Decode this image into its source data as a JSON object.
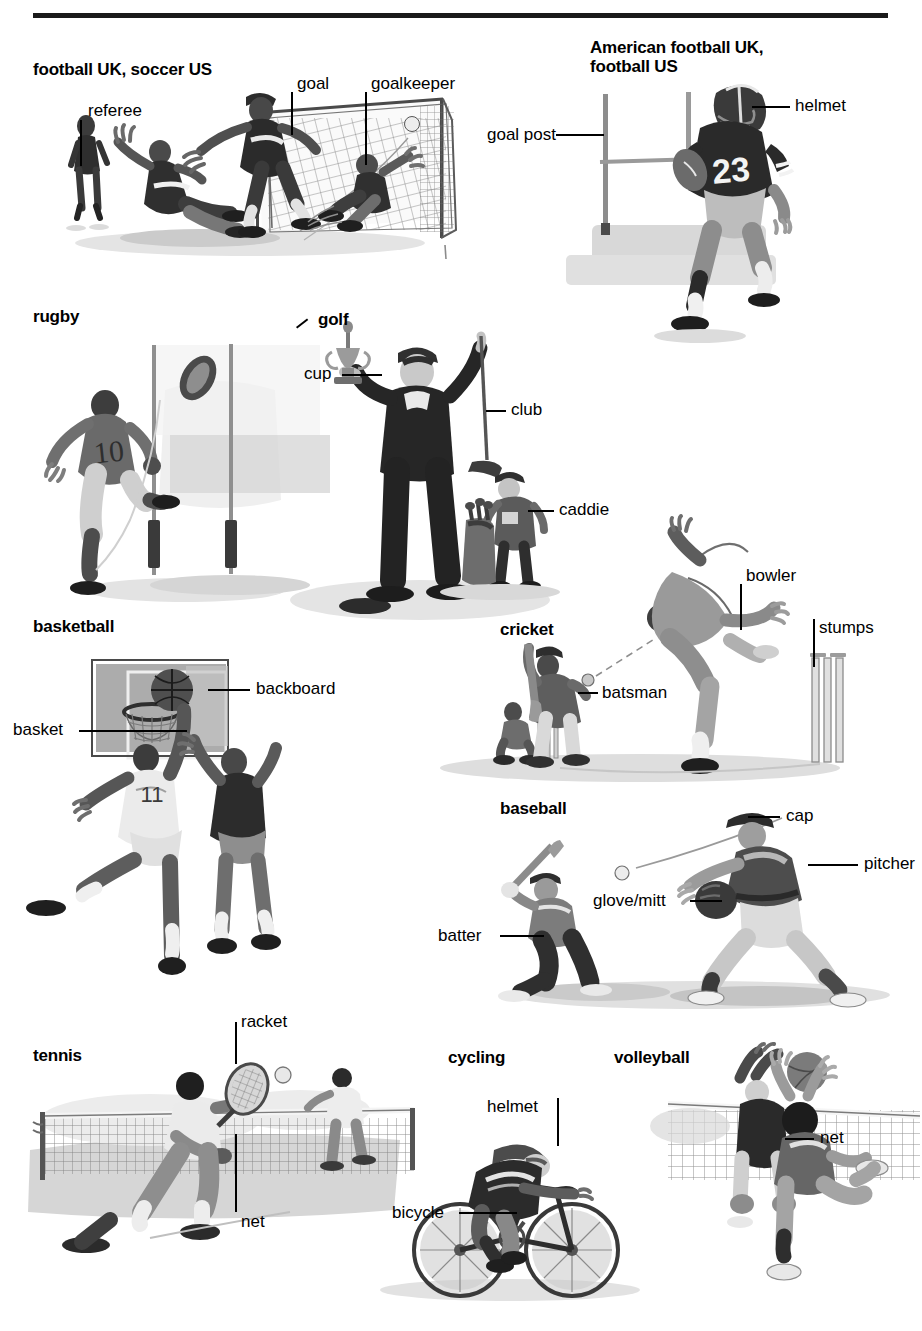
{
  "page": {
    "divider_color": "#1a1a1a",
    "background_color": "#ffffff",
    "text_color": "#000000"
  },
  "sections": [
    {
      "id": "football-soccer",
      "title": "football UK, soccer US",
      "labels": [
        {
          "id": "referee",
          "text": "referee"
        },
        {
          "id": "goal",
          "text": "goal"
        },
        {
          "id": "goalkeeper",
          "text": "goalkeeper"
        }
      ]
    },
    {
      "id": "american-football",
      "title": "American football UK,\nfootball US",
      "labels": [
        {
          "id": "goal-post",
          "text": "goal post"
        },
        {
          "id": "helmet",
          "text": "helmet"
        }
      ]
    },
    {
      "id": "rugby",
      "title": "rugby",
      "labels": []
    },
    {
      "id": "golf",
      "title": "golf",
      "labels": [
        {
          "id": "cup",
          "text": "cup"
        },
        {
          "id": "club",
          "text": "club"
        },
        {
          "id": "caddie",
          "text": "caddie"
        }
      ]
    },
    {
      "id": "basketball",
      "title": "basketball",
      "labels": [
        {
          "id": "backboard",
          "text": "backboard"
        },
        {
          "id": "basket",
          "text": "basket"
        }
      ]
    },
    {
      "id": "cricket",
      "title": "cricket",
      "labels": [
        {
          "id": "bowler",
          "text": "bowler"
        },
        {
          "id": "stumps",
          "text": "stumps"
        },
        {
          "id": "batsman",
          "text": "batsman"
        }
      ]
    },
    {
      "id": "baseball",
      "title": "baseball",
      "labels": [
        {
          "id": "cap",
          "text": "cap"
        },
        {
          "id": "pitcher",
          "text": "pitcher"
        },
        {
          "id": "glove-mitt",
          "text": "glove/mitt"
        },
        {
          "id": "batter",
          "text": "batter"
        }
      ]
    },
    {
      "id": "tennis",
      "title": "tennis",
      "labels": [
        {
          "id": "racket",
          "text": "racket"
        },
        {
          "id": "net",
          "text": "net"
        }
      ]
    },
    {
      "id": "cycling",
      "title": "cycling",
      "labels": [
        {
          "id": "helmet",
          "text": "helmet"
        },
        {
          "id": "bicycle",
          "text": "bicycle"
        }
      ]
    },
    {
      "id": "volleyball",
      "title": "volleyball",
      "labels": [
        {
          "id": "net",
          "text": "net"
        }
      ]
    }
  ],
  "jersey_numbers": {
    "american_football": "23",
    "rugby": "10"
  }
}
